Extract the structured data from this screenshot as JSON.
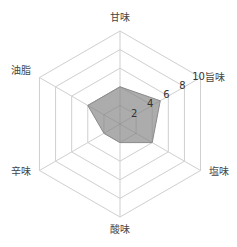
{
  "chart_data": {
    "type": "radar",
    "title": "",
    "categories": [
      "甘味",
      "旨味",
      "塩味",
      "酸味",
      "辛味",
      "油脂"
    ],
    "series": [
      {
        "name": "",
        "values": [
          4,
          5,
          4,
          2,
          2,
          4
        ]
      }
    ],
    "rlim": [
      0,
      10
    ],
    "ticks": [
      2,
      4,
      6,
      8,
      10
    ],
    "tick_labels": [
      "2",
      "4",
      "6",
      "8",
      "10"
    ],
    "grid": true,
    "legend": null,
    "colors": {
      "fill": "#a8a8a8",
      "stroke": "#8a8a8a",
      "grid": "#cfcfcf",
      "text": "#444444"
    }
  }
}
